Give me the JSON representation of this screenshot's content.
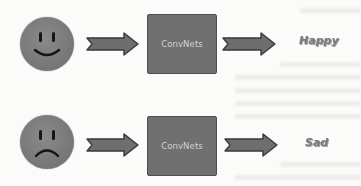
{
  "diagram": {
    "type": "flow",
    "rows": [
      {
        "input": {
          "icon": "happy-face-icon",
          "expression": "smile"
        },
        "model": {
          "label": "ConvNets"
        },
        "output": {
          "label": "Happy"
        }
      },
      {
        "input": {
          "icon": "sad-face-icon",
          "expression": "frown"
        },
        "model": {
          "label": "ConvNets"
        },
        "output": {
          "label": "Sad"
        }
      }
    ],
    "colors": {
      "face": "#7a7a7a",
      "box": "#707070",
      "box_border": "#4e4e4e",
      "arrow_fill": "#6e6e6e",
      "arrow_stroke": "#3a3a3a",
      "box_text": "#d2d2d2",
      "output_text": "#7a7a7a"
    }
  }
}
